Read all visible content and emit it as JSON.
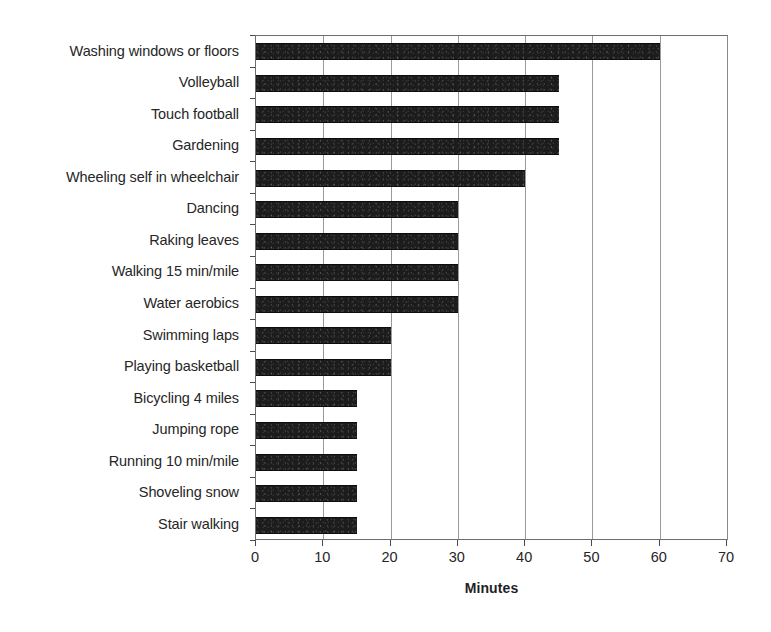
{
  "chart_data": {
    "type": "bar",
    "orientation": "horizontal",
    "title": "",
    "xlabel": "Minutes",
    "ylabel": "",
    "xlim": [
      0,
      70
    ],
    "xticks": [
      0,
      10,
      20,
      30,
      40,
      50,
      60,
      70
    ],
    "grid": true,
    "grid_axis": "x",
    "legend": false,
    "bar_color": "#1c1c1c",
    "categories": [
      "Washing windows or floors",
      "Volleyball",
      "Touch football",
      "Gardening",
      "Wheeling self in wheelchair",
      "Dancing",
      "Raking leaves",
      "Walking 15 min/mile",
      "Water aerobics",
      "Swimming laps",
      "Playing basketball",
      "Bicycling 4 miles",
      "Jumping rope",
      "Running 10 min/mile",
      "Shoveling snow",
      "Stair walking"
    ],
    "values": [
      60,
      45,
      45,
      45,
      40,
      30,
      30,
      30,
      30,
      20,
      20,
      15,
      15,
      15,
      15,
      15
    ]
  }
}
